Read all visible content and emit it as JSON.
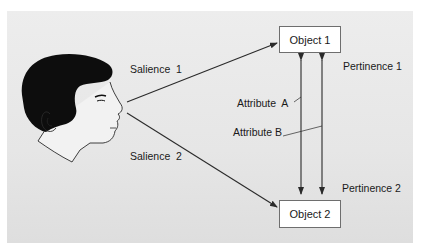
{
  "diagram": {
    "objects": [
      {
        "id": "object-1",
        "label": "Object 1"
      },
      {
        "id": "object-2",
        "label": "Object 2"
      }
    ],
    "labels": {
      "salience_1": "Salience  1",
      "salience_2": "Salience  2",
      "pertinence_1": "Pertinence 1",
      "pertinence_2": "Pertinence 2",
      "attribute_a": "Attribute  A",
      "attribute_b": "Attribute B"
    },
    "edges": [
      {
        "from": "observer",
        "to": "object-1",
        "label": "Salience 1"
      },
      {
        "from": "observer",
        "to": "object-2",
        "label": "Salience 2"
      },
      {
        "from": "object-2",
        "to": "object-1",
        "label": "Attribute A",
        "bidirectional": true
      },
      {
        "from": "object-2",
        "to": "object-1",
        "label": "Attribute B",
        "bidirectional": true
      }
    ],
    "colors": {
      "panel": "#e8e8e8",
      "line": "#2a2a2a",
      "box": "#ffffff",
      "hair": "#111111"
    }
  }
}
